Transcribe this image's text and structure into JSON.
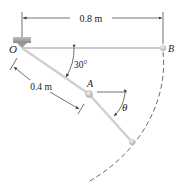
{
  "figure": {
    "labels": {
      "point_o": "O",
      "point_a": "A",
      "point_b": "B",
      "angle_theta": "θ"
    },
    "dimensions": {
      "span_ob": "0.8 m",
      "length_oa": "0.4 m",
      "angle_oa": "30°"
    },
    "colors": {
      "rod": "#cfcfcf",
      "line": "#333333",
      "support": "#9a9a9a",
      "ball": "#d8d8d8"
    }
  }
}
